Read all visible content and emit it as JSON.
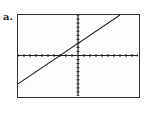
{
  "figure": {
    "label": "a."
  },
  "chart_data": {
    "type": "line",
    "title": "",
    "xlabel": "",
    "ylabel": "",
    "xlim": [
      -10,
      10
    ],
    "ylim": [
      -10,
      10
    ],
    "x_ticks_step": 1,
    "y_ticks_step": 1,
    "grid": false,
    "series": [
      {
        "name": "y = x + 3",
        "x": [
          -10,
          7
        ],
        "y": [
          -7,
          10
        ]
      }
    ],
    "x_intercept": -3,
    "y_intercept": 3,
    "colors": {
      "line": "#222222",
      "axes": "#222222",
      "frame": "#333333"
    }
  }
}
